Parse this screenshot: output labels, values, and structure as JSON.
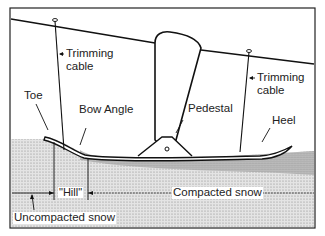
{
  "diagram": {
    "type": "technical-illustration",
    "labels": {
      "trimming_cable_left_1": "Trimming",
      "trimming_cable_left_2": "cable",
      "trimming_cable_right_1": "Trimming",
      "trimming_cable_right_2": "cable",
      "toe": "Toe",
      "bow_angle": "Bow Angle",
      "pedestal": "Pedestal",
      "heel": "Heel",
      "hill": "\"Hill\"",
      "compacted_snow": "Compacted snow",
      "uncompacted_snow": "Uncompacted snow"
    },
    "colors": {
      "line": "#1a1a1a",
      "snow_fill": "#d8d8d8",
      "compacted_fill": "#bdbdbd",
      "background": "#ffffff"
    }
  }
}
